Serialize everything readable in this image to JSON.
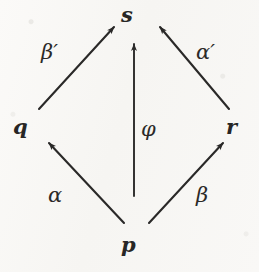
{
  "diagram": {
    "kind": "commutative-diagram",
    "background_color": "#f8f7f5",
    "ink_color": "#2a2928",
    "nodes": [
      {
        "id": "s",
        "label": "s",
        "x": 130,
        "y": 14
      },
      {
        "id": "q",
        "label": "q",
        "x": 20,
        "y": 127
      },
      {
        "id": "r",
        "label": "r",
        "x": 232,
        "y": 127
      },
      {
        "id": "p",
        "label": "p",
        "x": 130,
        "y": 245
      }
    ],
    "arrows": [
      {
        "id": "beta-prime",
        "label": "β′",
        "from": "q",
        "to": "s",
        "x1": 39,
        "y1": 109,
        "x2": 114,
        "y2": 27,
        "label_x": 41,
        "label_y": 42
      },
      {
        "id": "alpha-prime",
        "label": "α′",
        "from": "r",
        "to": "s",
        "x1": 229,
        "y1": 109,
        "x2": 160,
        "y2": 27,
        "label_x": 196,
        "label_y": 42
      },
      {
        "id": "phi",
        "label": "φ",
        "from": "p",
        "to": "s",
        "x1": 134,
        "y1": 196,
        "x2": 134,
        "y2": 44,
        "label_x": 141,
        "label_y": 119
      },
      {
        "id": "alpha",
        "label": "α",
        "from": "p",
        "to": "q",
        "x1": 124,
        "y1": 223,
        "x2": 49,
        "y2": 143,
        "label_x": 48,
        "label_y": 185
      },
      {
        "id": "beta",
        "label": "β",
        "from": "p",
        "to": "r",
        "x1": 149,
        "y1": 223,
        "x2": 223,
        "y2": 143,
        "label_x": 196,
        "label_y": 185
      }
    ]
  }
}
